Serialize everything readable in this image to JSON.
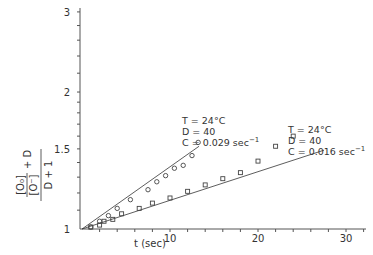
{
  "chart_data": {
    "type": "scatter",
    "title": "",
    "xlabel": "t (sec)",
    "ylabel": "([O0]/[O-] + D) / (D + 1)",
    "ylabel_parts": {
      "numerator_fraction_top": "[O₀]",
      "numerator_fraction_bottom": "[O⁻]",
      "numerator_plus": "+ D",
      "denominator": "D + 1"
    },
    "xlim": [
      0,
      33
    ],
    "ylim": [
      1,
      3
    ],
    "yscale": "log",
    "x_ticks": [
      10,
      20,
      30
    ],
    "x_minor_step": 2,
    "y_ticks": [
      1,
      1.5,
      2,
      3
    ],
    "y_tick_labels": [
      "1",
      "1.5",
      "2",
      "3"
    ],
    "grid": false,
    "legend": "none (inline annotations)",
    "series": [
      {
        "name": "C = 0.029 sec^-1",
        "marker": "circle",
        "points": [
          {
            "x": 1.0,
            "y": 1.01
          },
          {
            "x": 2.0,
            "y": 1.04
          },
          {
            "x": 3.0,
            "y": 1.07
          },
          {
            "x": 4.0,
            "y": 1.11
          },
          {
            "x": 5.5,
            "y": 1.16
          },
          {
            "x": 7.5,
            "y": 1.22
          },
          {
            "x": 8.5,
            "y": 1.27
          },
          {
            "x": 9.5,
            "y": 1.31
          },
          {
            "x": 10.5,
            "y": 1.36
          },
          {
            "x": 11.5,
            "y": 1.38
          },
          {
            "x": 12.5,
            "y": 1.45
          },
          {
            "x": 13.2,
            "y": 1.55
          }
        ],
        "fit": {
          "x0": 0,
          "y0": 1.0,
          "x1": 13.3,
          "y1": 1.52
        }
      },
      {
        "name": "C = 0.016 sec^-1",
        "marker": "square",
        "points": [
          {
            "x": 1.0,
            "y": 1.01
          },
          {
            "x": 2.0,
            "y": 1.02
          },
          {
            "x": 2.5,
            "y": 1.04
          },
          {
            "x": 3.5,
            "y": 1.05
          },
          {
            "x": 4.5,
            "y": 1.08
          },
          {
            "x": 6.5,
            "y": 1.11
          },
          {
            "x": 8.0,
            "y": 1.14
          },
          {
            "x": 10.0,
            "y": 1.17
          },
          {
            "x": 12.0,
            "y": 1.21
          },
          {
            "x": 14.0,
            "y": 1.25
          },
          {
            "x": 16.0,
            "y": 1.29
          },
          {
            "x": 18.0,
            "y": 1.33
          },
          {
            "x": 20.0,
            "y": 1.41
          },
          {
            "x": 22.0,
            "y": 1.52
          },
          {
            "x": 24.0,
            "y": 1.6
          }
        ],
        "fit": {
          "x0": 0,
          "y0": 1.0,
          "x1": 27.5,
          "y1": 1.49
        }
      }
    ],
    "annotations": [
      {
        "series": 0,
        "lines": [
          "T = 24°C",
          "D = 40",
          "C = 0.029 sec"
        ],
        "sup": "−1"
      },
      {
        "series": 1,
        "lines": [
          "T = 24°C",
          "D = 40",
          "C = 0.016 sec"
        ],
        "sup": "−1"
      }
    ]
  }
}
